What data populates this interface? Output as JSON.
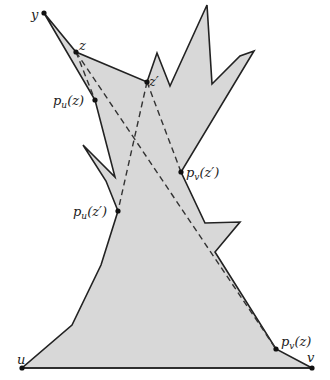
{
  "diagram": {
    "type": "polygon-visibility-figure",
    "colors": {
      "fill": "#d8d8d8",
      "stroke": "#222222",
      "dashed": "#333333",
      "point": "#111111"
    },
    "polygon_points": "44,13 76,52 147,82 157,53 170,86 207,5 212,84 240,56 254,51 181,172 205,223 240,222 215,252 276,349 312,368 22,368 72,325 101,265 118,211 106,181 83,145 115,177 95,100",
    "dashed_segments": [
      {
        "from": "z",
        "to": "p_u(z)",
        "x1": 76,
        "y1": 52,
        "x2": 95,
        "y2": 100
      },
      {
        "from": "z",
        "to": "p_v(z)",
        "x1": 76,
        "y1": 52,
        "x2": 276,
        "y2": 349
      },
      {
        "from": "z'",
        "to": "p_u(z')",
        "x1": 147,
        "y1": 82,
        "x2": 118,
        "y2": 211
      },
      {
        "from": "z'",
        "to": "p_v(z')",
        "x1": 147,
        "y1": 82,
        "x2": 181,
        "y2": 172
      }
    ],
    "points": [
      {
        "id": "y",
        "x": 44,
        "y": 13
      },
      {
        "id": "z",
        "x": 76,
        "y": 52
      },
      {
        "id": "z'",
        "x": 147,
        "y": 82
      },
      {
        "id": "p_u(z)",
        "x": 95,
        "y": 100
      },
      {
        "id": "p_v(z')",
        "x": 181,
        "y": 172
      },
      {
        "id": "p_u(z')",
        "x": 118,
        "y": 211
      },
      {
        "id": "p_v(z)",
        "x": 276,
        "y": 349
      },
      {
        "id": "u",
        "x": 22,
        "y": 368
      },
      {
        "id": "v",
        "x": 312,
        "y": 368
      }
    ],
    "labels": {
      "y": {
        "base": "y",
        "x": 31,
        "y": 19
      },
      "z": {
        "base": "z",
        "x": 79,
        "y": 50
      },
      "z_prime": {
        "base": "z′",
        "x": 149,
        "y": 85
      },
      "pu_z": {
        "base": "p",
        "sub": "u",
        "rest": "(z)",
        "x": 53,
        "y": 105
      },
      "pv_z_prime": {
        "base": "p",
        "sub": "v",
        "rest": "(z′)",
        "x": 186,
        "y": 177
      },
      "pu_z_prime": {
        "base": "p",
        "sub": "u",
        "rest": "(z′)",
        "x": 73,
        "y": 216
      },
      "pv_z": {
        "base": "p",
        "sub": "v",
        "rest": "(z)",
        "x": 281,
        "y": 346
      },
      "u": {
        "base": "u",
        "x": 17,
        "y": 364
      },
      "v": {
        "base": "v",
        "x": 307,
        "y": 362
      }
    }
  }
}
